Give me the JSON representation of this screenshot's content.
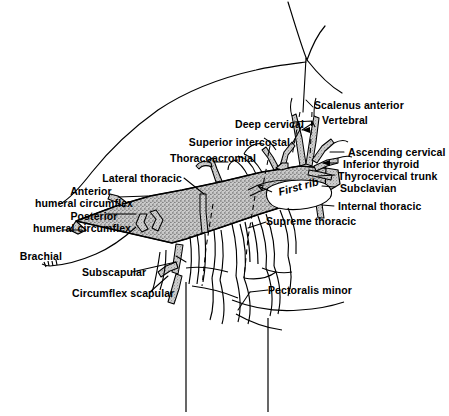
{
  "figure": {
    "kind": "anatomical-line-drawing",
    "width": 449,
    "height": 416,
    "background_color": "#ffffff",
    "ink_color": "#000000",
    "vessel_fill_color": "#9a9a9a",
    "vessel_stipple_color": "#4d4d4d"
  },
  "labels": {
    "scalenus_anterior": "Scalenus anterior",
    "vertebral": "Vertebral",
    "ascending_cervical": "Ascending cervical",
    "inferior_thyroid": "Inferior thyroid",
    "thyrocervical_trunk": "Thyrocervical trunk",
    "subclavian": "Subclavian",
    "internal_thoracic": "Internal thoracic",
    "deep_cervical": "Deep cervical",
    "superior_intercostal": "Superior intercostal",
    "thoracoacromial": "Thoracoacromial",
    "lateral_thoracic": "Lateral thoracic",
    "anterior": "Anterior",
    "anterior_humeral_circumflex": "humeral circumflex",
    "posterior": "Posterior",
    "posterior_humeral_circumflex": "humeral circumflex",
    "brachial": "Brachial",
    "subscapular": "Subscapular",
    "circumflex_scapular": "Circumflex scapular",
    "supreme_thoracic": "Supreme thoracic",
    "pectoralis_minor": "Pectoralis minor",
    "first_rib": "First rib"
  }
}
